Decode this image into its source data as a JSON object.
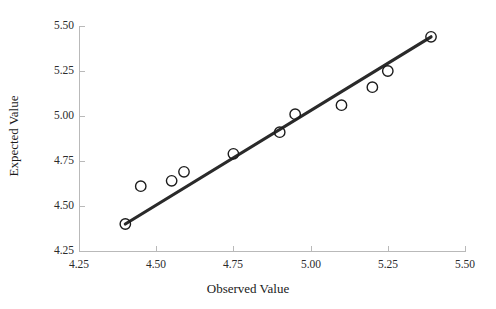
{
  "chart_data": {
    "type": "scatter",
    "title": "",
    "xlabel": "Observed Value",
    "ylabel": "Expected Value",
    "xlim": [
      4.25,
      5.5
    ],
    "ylim": [
      4.25,
      5.5
    ],
    "xticks": [
      "4.25",
      "4.50",
      "4.75",
      "5.00",
      "5.25",
      "5.50"
    ],
    "yticks": [
      "4.25",
      "4.50",
      "4.75",
      "5.00",
      "5.25",
      "5.50"
    ],
    "xtick_values": [
      4.25,
      4.5,
      4.75,
      5.0,
      5.25,
      5.5
    ],
    "ytick_values": [
      4.25,
      4.5,
      4.75,
      5.0,
      5.25,
      5.5
    ],
    "grid": false,
    "legend": null,
    "marker_style": "open-circle",
    "points": [
      {
        "x": 4.4,
        "y": 4.4
      },
      {
        "x": 4.45,
        "y": 4.61
      },
      {
        "x": 4.55,
        "y": 4.64
      },
      {
        "x": 4.59,
        "y": 4.69
      },
      {
        "x": 4.75,
        "y": 4.79
      },
      {
        "x": 4.9,
        "y": 4.91
      },
      {
        "x": 4.95,
        "y": 5.01
      },
      {
        "x": 5.1,
        "y": 5.06
      },
      {
        "x": 5.2,
        "y": 5.16
      },
      {
        "x": 5.25,
        "y": 5.25
      },
      {
        "x": 5.39,
        "y": 5.44
      }
    ],
    "trend_line": {
      "type": "reference-line",
      "x0": 4.4,
      "y0": 4.4,
      "x1": 5.39,
      "y1": 5.44,
      "color": "#2a2a2a"
    },
    "colors": {
      "marker_stroke": "#1c1c1c",
      "line": "#2a2a2a",
      "axis": "#b9b9b9",
      "background": "#ffffff"
    }
  }
}
